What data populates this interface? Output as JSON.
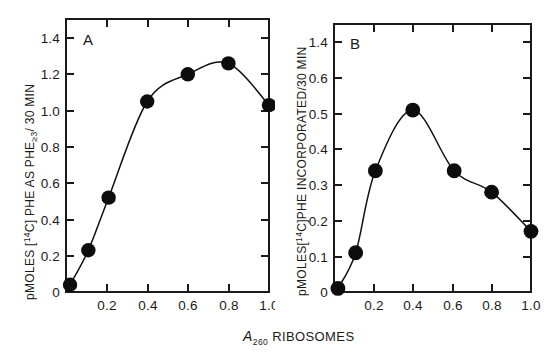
{
  "figure": {
    "background_color": "#ffffff",
    "ink_color": "#111111",
    "shared_xaxis_label_main": "RIBOSOMES",
    "shared_xaxis_label_symbol": "A",
    "shared_xaxis_label_subscript": "260"
  },
  "panels": [
    {
      "letter": "A",
      "ylabel_parts": {
        "prefix": "pMOLES [",
        "isotope_sup": "14",
        "isotope_elem": "C",
        "middle": "] PHE AS PHE",
        "sub": "≥3",
        "suffix": "/ 30 MIN"
      },
      "ylabel_plain": "pMOLES [14C] PHE AS PHE≥3 / 30 MIN",
      "ytick_labels": [
        "1.4",
        "1.2",
        "1.0",
        "0.8",
        "0.6",
        "0.4",
        "0.2",
        "0"
      ],
      "xtick_labels": [
        "0.2",
        "0.4",
        "0.6",
        "0.8",
        "1.0"
      ]
    },
    {
      "letter": "B",
      "ylabel_parts": {
        "prefix": "pMOLES[",
        "isotope_sup": "14",
        "isotope_elem": "C",
        "middle": "]PHE INCORPORATED/30 MIN",
        "sub": "",
        "suffix": ""
      },
      "ylabel_plain": "pMOLES[14C]PHE INCORPORATED/30 MIN",
      "ytick_labels": [
        "1.4",
        "0.6",
        "0.5",
        "0.4",
        "0.3",
        "0.2",
        "0.1",
        "0"
      ],
      "xtick_labels": [
        "0.2",
        "0.4",
        "0.6",
        "0.8",
        "1.0"
      ]
    }
  ],
  "chart_data": [
    {
      "type": "line",
      "panel": "A",
      "title": "A",
      "xlabel": "A260 RIBOSOMES",
      "ylabel": "pMOLES [14C] PHE AS PHE≥3 / 30 MIN",
      "x": [
        0.02,
        0.11,
        0.21,
        0.4,
        0.6,
        0.8,
        1.0
      ],
      "values": [
        0.04,
        0.23,
        0.52,
        1.05,
        1.2,
        1.26,
        1.03
      ],
      "xlim": [
        0.0,
        1.12
      ],
      "ylim": [
        0.0,
        1.5
      ],
      "xticks": [
        0.2,
        0.4,
        0.6,
        0.8,
        1.0
      ],
      "yticks": [
        0.0,
        0.2,
        0.4,
        0.6,
        0.8,
        1.0,
        1.2,
        1.4
      ],
      "grid": false,
      "legend": false,
      "marker": "filled-circle",
      "marker_color": "#0d0d0d",
      "line_color": "#111111"
    },
    {
      "type": "line",
      "panel": "B",
      "title": "B",
      "xlabel": "A260 RIBOSOMES",
      "ylabel": "pMOLES[14C]PHE INCORPORATED/30 MIN",
      "x": [
        0.02,
        0.11,
        0.21,
        0.4,
        0.61,
        0.8,
        1.0
      ],
      "values": [
        0.01,
        0.11,
        0.34,
        0.51,
        0.34,
        0.28,
        0.17
      ],
      "xlim": [
        0.0,
        1.12
      ],
      "ylim": [
        0.0,
        0.65
      ],
      "xticks": [
        0.2,
        0.4,
        0.6,
        0.8,
        1.0
      ],
      "yticks": [
        0.0,
        0.1,
        0.2,
        0.3,
        0.4,
        0.5,
        0.6
      ],
      "ytick_label_override_top": "1.4",
      "grid": false,
      "legend": false,
      "marker": "filled-circle",
      "marker_color": "#0d0d0d",
      "line_color": "#111111"
    }
  ]
}
